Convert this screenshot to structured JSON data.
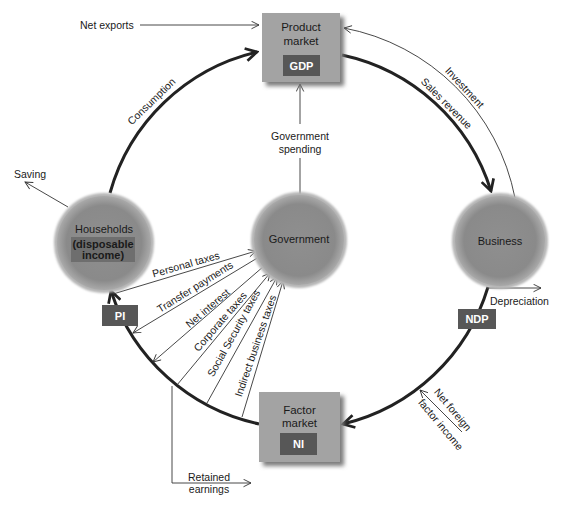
{
  "nodes": {
    "product_market": {
      "title_line1": "Product",
      "title_line2": "market",
      "badge": "GDP"
    },
    "factor_market": {
      "title_line1": "Factor",
      "title_line2": "market",
      "badge": "NI"
    },
    "households": {
      "title": "Households",
      "sub_line1": "(disposable",
      "sub_line2": "income)"
    },
    "government": {
      "title": "Government"
    },
    "business": {
      "title": "Business"
    }
  },
  "badges": {
    "pi": "PI",
    "ndp": "NDP"
  },
  "flows": {
    "net_exports": "Net exports",
    "consumption": "Consumption",
    "investment": "Investment",
    "sales_revenue": "Sales revenue",
    "saving": "Saving",
    "government_spending_line1": "Government",
    "government_spending_line2": "spending",
    "depreciation": "Depreciation",
    "net_foreign_line1": "Net foreign",
    "net_foreign_line2": "factor income",
    "retained_line1": "Retained",
    "retained_line2": "earnings",
    "personal_taxes": "Personal taxes",
    "transfer_payments": "Transfer payments",
    "net_interest": "Net interest",
    "corporate_taxes": "Corporate taxes",
    "social_security_taxes": "Social Security taxes",
    "indirect_business_taxes": "Indirect business taxes"
  },
  "colors": {
    "circle_fill": "#8c8c8c",
    "box_fill": "#a3a3a3",
    "badge_fill": "#575757",
    "line": "#222222"
  }
}
